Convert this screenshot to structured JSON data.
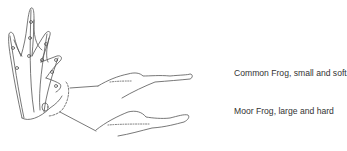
{
  "diagram": {
    "labels": [
      {
        "text": "Common Frog, small and soft"
      },
      {
        "text": "Moor Frog, large and hard"
      }
    ],
    "colors": {
      "line": "#444444",
      "text": "#333333",
      "background": "#ffffff"
    }
  }
}
